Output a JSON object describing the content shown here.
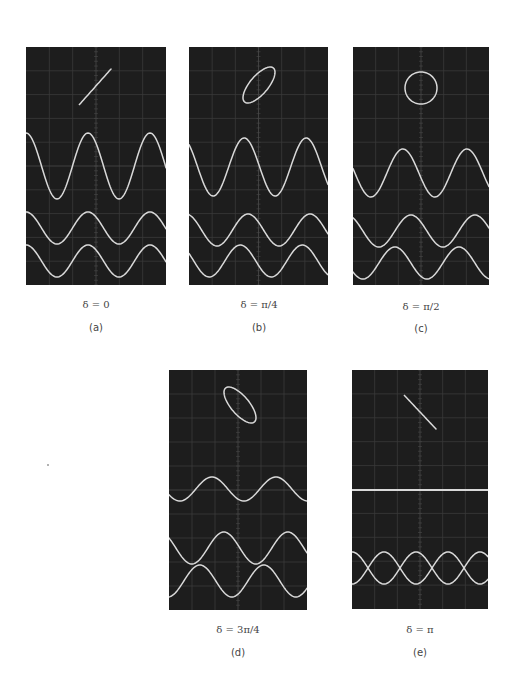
{
  "figure": {
    "colors": {
      "screen_bg": "#1d1d1d",
      "grid": "#3a3a3a",
      "grid_center": "#4a4a4a",
      "trace": "#d9d9d9",
      "page_bg": "#ffffff"
    },
    "grid": {
      "cols": 6,
      "rows": 10
    },
    "panels": [
      {
        "id": "a",
        "letter": "(a)",
        "delta_label": "δ = 0",
        "delta": 0,
        "box": {
          "x": 26,
          "y": 47,
          "w": 140,
          "h": 238
        },
        "lissajous": {
          "type": "line",
          "cx": 95,
          "cy": 87,
          "ax": 16,
          "ay": 18
        },
        "sum_wave": {
          "center": 119,
          "amp": 33
        },
        "comp1": {
          "center": 181,
          "amp": 16
        },
        "comp2": {
          "center": 214,
          "amp": 16
        },
        "period": 62,
        "phase0": 0,
        "delta_pos": {
          "x": 26,
          "y": 299
        },
        "letter_pos": {
          "x": 26,
          "y": 322
        }
      },
      {
        "id": "b",
        "letter": "(b)",
        "delta_label": "δ = π/4",
        "delta": 0.7854,
        "box": {
          "x": 189,
          "y": 47,
          "w": 139,
          "h": 238
        },
        "lissajous": {
          "type": "ellipse",
          "cx": 259,
          "cy": 85,
          "ax": 16,
          "ay": 18
        },
        "sum_wave": {
          "center": 120,
          "amp": 29
        },
        "comp1": {
          "center": 183,
          "amp": 16
        },
        "comp2": {
          "center": 214,
          "amp": 16
        },
        "period": 62,
        "phase0": 0.3,
        "delta_pos": {
          "x": 189,
          "y": 299
        },
        "letter_pos": {
          "x": 189,
          "y": 322
        }
      },
      {
        "id": "c",
        "letter": "(c)",
        "delta_label": "δ = π/2",
        "delta": 1.5708,
        "box": {
          "x": 353,
          "y": 47,
          "w": 136,
          "h": 238
        },
        "lissajous": {
          "type": "ellipse",
          "cx": 421,
          "cy": 88,
          "ax": 16,
          "ay": 16
        },
        "sum_wave": {
          "center": 126,
          "amp": 24
        },
        "comp1": {
          "center": 184,
          "amp": 16
        },
        "comp2": {
          "center": 216,
          "amp": 16
        },
        "period": 64,
        "phase0": 0.6,
        "delta_pos": {
          "x": 351,
          "y": 301
        },
        "letter_pos": {
          "x": 351,
          "y": 323
        }
      },
      {
        "id": "d",
        "letter": "(d)",
        "delta_label": "δ = 3π/4",
        "delta": 2.3562,
        "box": {
          "x": 169,
          "y": 370,
          "w": 138,
          "h": 240
        },
        "lissajous": {
          "type": "ellipse",
          "cx": 240,
          "cy": 405,
          "ax": 16,
          "ay": 18
        },
        "sum_wave": {
          "center": 119,
          "amp": 12
        },
        "comp1": {
          "center": 178,
          "amp": 16
        },
        "comp2": {
          "center": 211,
          "amp": 16
        },
        "period": 64,
        "phase0": 0.9,
        "delta_pos": {
          "x": 168,
          "y": 624
        },
        "letter_pos": {
          "x": 168,
          "y": 647
        }
      },
      {
        "id": "e",
        "letter": "(e)",
        "delta_label": "δ = π",
        "delta": 3.1416,
        "box": {
          "x": 352,
          "y": 370,
          "w": 136,
          "h": 239
        },
        "lissajous": {
          "type": "line",
          "cx": 420,
          "cy": 412,
          "ax": 16,
          "ay": 17
        },
        "sum_wave": {
          "center": 120,
          "amp": 0
        },
        "comp1": {
          "center": 198,
          "amp": 16
        },
        "comp2": {
          "center": 198,
          "amp": 16
        },
        "period": 64,
        "phase0": 0,
        "delta_pos": {
          "x": 350,
          "y": 624
        },
        "letter_pos": {
          "x": 350,
          "y": 647
        }
      }
    ]
  }
}
